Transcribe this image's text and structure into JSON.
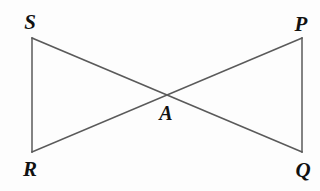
{
  "figure": {
    "background_color": "#fdfdfd",
    "line_color": "#5a5a5a",
    "label_color": "#111111",
    "line_width": 1.5,
    "width": 320,
    "height": 191
  },
  "labels": {
    "s": "S",
    "p": "P",
    "r": "R",
    "q": "Q",
    "a": "A"
  },
  "chart_data": {
    "type": "diagram",
    "title": "",
    "points": [
      {
        "name": "S",
        "x": 32,
        "y": 38,
        "label_x": 30,
        "label_y": 22
      },
      {
        "name": "P",
        "x": 302,
        "y": 38,
        "label_x": 301,
        "label_y": 24
      },
      {
        "name": "R",
        "x": 32,
        "y": 152,
        "label_x": 30,
        "label_y": 169
      },
      {
        "name": "Q",
        "x": 302,
        "y": 152,
        "label_x": 303,
        "label_y": 170
      },
      {
        "name": "A",
        "x": 166,
        "y": 96,
        "label_x": 166,
        "label_y": 113
      }
    ],
    "segments": [
      {
        "name": "SR",
        "from": "S",
        "to": "R",
        "x1": 32,
        "y1": 38,
        "x2": 32,
        "y2": 152
      },
      {
        "name": "PQ",
        "from": "P",
        "to": "Q",
        "x1": 302,
        "y1": 38,
        "x2": 302,
        "y2": 152
      },
      {
        "name": "SQ",
        "from": "S",
        "to": "Q",
        "x1": 32,
        "y1": 38,
        "x2": 302,
        "y2": 152
      },
      {
        "name": "RP",
        "from": "R",
        "to": "P",
        "x1": 32,
        "y1": 152,
        "x2": 302,
        "y2": 38
      }
    ],
    "intersection": {
      "name": "A",
      "x": 166,
      "y": 96
    }
  }
}
